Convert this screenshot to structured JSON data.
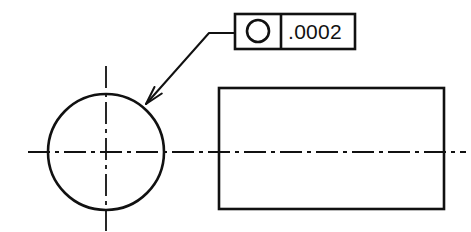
{
  "drawing": {
    "title": "Circularity (Roundness) Geometric Tolerance Callout",
    "background_color": "#ffffff",
    "line_color": "#111111",
    "views": {
      "end_view": {
        "name": "end-view-circle",
        "shape": "circle",
        "center_x": 106,
        "center_y": 152,
        "radius": 58,
        "line_width": 2.6
      },
      "side_view": {
        "name": "side-view-rectangle",
        "shape": "rectangle",
        "x": 219,
        "y": 88,
        "width": 225,
        "height": 121,
        "line_width": 2.6
      }
    },
    "centerlines": {
      "style": "dash-dot",
      "line_width": 1.8,
      "horizontal": {
        "y": 152,
        "x_start": 28,
        "x_end": 466
      },
      "vertical": {
        "x": 106,
        "y_start": 66,
        "y_end": 231
      }
    },
    "leader": {
      "name": "leader-line",
      "landing_y": 33,
      "landing_x_start": 209,
      "landing_x_end": 235,
      "elbow_x": 209,
      "elbow_y": 33,
      "arrow_tip_x": 146,
      "arrow_tip_y": 104,
      "line_width": 2.0,
      "arrowhead_style": "open-thin"
    }
  },
  "feature_control_frame": {
    "name": "feature-control-frame",
    "x": 235,
    "y": 14,
    "width": 120,
    "height": 35,
    "divider_x": 281,
    "border_width": 2.6,
    "symbol": {
      "name": "circularity-symbol",
      "label": "circularity",
      "glyph": "circle",
      "center_x": 258,
      "center_y": 31,
      "radius": 11,
      "stroke_width": 2.6
    },
    "tolerance": {
      "label": ".0002",
      "text_x": 288,
      "text_y": 39
    }
  }
}
